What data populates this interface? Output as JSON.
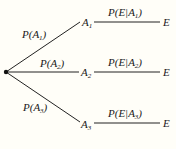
{
  "diagram": {
    "type": "probability-tree",
    "root": {
      "x": 6,
      "y": 72
    },
    "branches": [
      {
        "first_label": {
          "base": "P(A",
          "sub": "1",
          "close": ")"
        },
        "node": {
          "base": "A",
          "sub": "1"
        },
        "second_label": {
          "base": "P(E|A",
          "sub": "1",
          "close": ")"
        },
        "end": "E",
        "y": 22
      },
      {
        "first_label": {
          "base": "P(A",
          "sub": "2",
          "close": ")"
        },
        "node": {
          "base": "A",
          "sub": "2"
        },
        "second_label": {
          "base": "P(E|A",
          "sub": "2",
          "close": ")"
        },
        "end": "E",
        "y": 72
      },
      {
        "first_label": {
          "base": "P(A",
          "sub": "3",
          "close": ")"
        },
        "node": {
          "base": "A",
          "sub": "3"
        },
        "second_label": {
          "base": "P(E|A",
          "sub": "3",
          "close": ")"
        },
        "end": "E",
        "y": 123
      }
    ]
  }
}
